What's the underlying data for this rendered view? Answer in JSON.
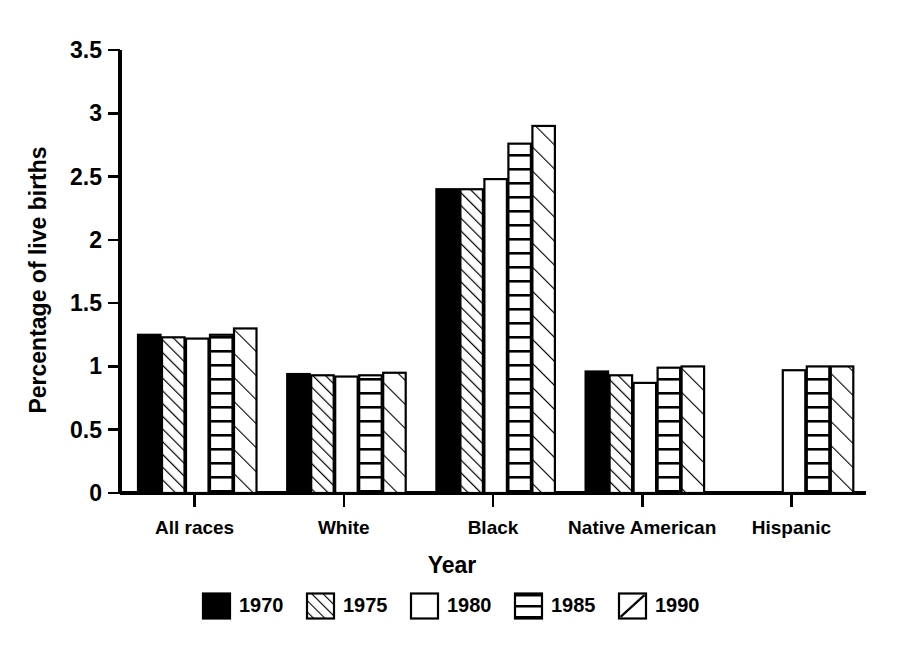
{
  "chart_data": {
    "type": "bar",
    "title": "",
    "xlabel": "Year",
    "ylabel": "Percentage of live births",
    "categories": [
      "All races",
      "White",
      "Black",
      "Native American",
      "Hispanic"
    ],
    "legend_position": "bottom",
    "grid": false,
    "ylim": [
      0,
      3.5
    ],
    "yticks": [
      "0",
      "0.5",
      "1",
      "1.5",
      "2",
      "2.5",
      "3",
      "3.5"
    ],
    "ytick_values": [
      0,
      0.5,
      1,
      1.5,
      2,
      2.5,
      3,
      3.5
    ],
    "series": [
      {
        "name": "1970",
        "pattern": "solid-black",
        "values": [
          1.25,
          0.94,
          2.4,
          0.96,
          null
        ]
      },
      {
        "name": "1975",
        "pattern": "diagonal-dense",
        "values": [
          1.23,
          0.93,
          2.4,
          0.93,
          null
        ]
      },
      {
        "name": "1980",
        "pattern": "blank-white",
        "values": [
          1.22,
          0.92,
          2.48,
          0.87,
          0.97
        ]
      },
      {
        "name": "1985",
        "pattern": "horizontal-lines",
        "values": [
          1.25,
          0.93,
          2.76,
          0.99,
          1.0
        ]
      },
      {
        "name": "1990",
        "pattern": "diagonal-sparse",
        "values": [
          1.3,
          0.95,
          2.9,
          1.0,
          1.0
        ]
      }
    ]
  },
  "legend": {
    "title": "Year",
    "entries": [
      {
        "label": "1970",
        "pattern": "solid-black"
      },
      {
        "label": "1975",
        "pattern": "diagonal-dense"
      },
      {
        "label": "1980",
        "pattern": "blank-white"
      },
      {
        "label": "1985",
        "pattern": "horizontal-lines"
      },
      {
        "label": "1990",
        "pattern": "diagonal-sparse"
      }
    ]
  },
  "colors": {
    "ink": "#000000",
    "paper": "#ffffff"
  }
}
